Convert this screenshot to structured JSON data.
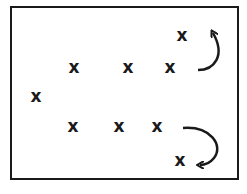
{
  "diagram": {
    "type": "formation-diagram",
    "frame": {
      "stroke": "#1a1a1a"
    },
    "marks": [
      {
        "id": "x-top-right",
        "label": "x",
        "x": 182,
        "y": 36
      },
      {
        "id": "x-upper-1",
        "label": "x",
        "x": 74,
        "y": 68
      },
      {
        "id": "x-upper-2",
        "label": "x",
        "x": 128,
        "y": 68
      },
      {
        "id": "x-upper-3",
        "label": "x",
        "x": 170,
        "y": 68
      },
      {
        "id": "x-left",
        "label": "x",
        "x": 36,
        "y": 97
      },
      {
        "id": "x-lower-1",
        "label": "x",
        "x": 73,
        "y": 127
      },
      {
        "id": "x-lower-2",
        "label": "x",
        "x": 119,
        "y": 127
      },
      {
        "id": "x-lower-3",
        "label": "x",
        "x": 157,
        "y": 127
      },
      {
        "id": "x-bottom-right",
        "label": "x",
        "x": 180,
        "y": 161
      }
    ],
    "arrows": [
      {
        "id": "arrow-upper",
        "direction": "curve-up",
        "from": "x-upper-3",
        "to": "x-top-right"
      },
      {
        "id": "arrow-lower",
        "direction": "curve-down",
        "from": "x-lower-3",
        "to": "x-bottom-right"
      }
    ],
    "ink_color": "#1a1a1a"
  }
}
